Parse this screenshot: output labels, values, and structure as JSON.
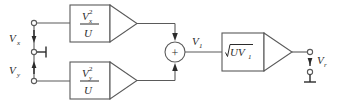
{
  "diagram": {
    "colors": {
      "background": "#ffffff",
      "wire": "#5a5a5a",
      "text": "#2b2b2b",
      "box_fill": "#ffffff"
    }
  },
  "inputs": {
    "vx": {
      "label": "V",
      "subscript": "x"
    },
    "vy": {
      "label": "V",
      "subscript": "y"
    }
  },
  "blocks": {
    "squarer_x": {
      "numerator_base": "V",
      "numerator_sub": "x",
      "numerator_sup": "2",
      "denominator": "U"
    },
    "squarer_y": {
      "numerator_base": "V",
      "numerator_sub": "y",
      "numerator_sup": "2",
      "denominator": "U"
    },
    "sqrt": {
      "radicand": "UV",
      "radicand_sub": "1"
    }
  },
  "summer": {
    "sign": "+"
  },
  "nodes": {
    "v1": {
      "label": "V",
      "subscript": "1"
    }
  },
  "output": {
    "vr": {
      "label": "V",
      "subscript": "r"
    }
  }
}
